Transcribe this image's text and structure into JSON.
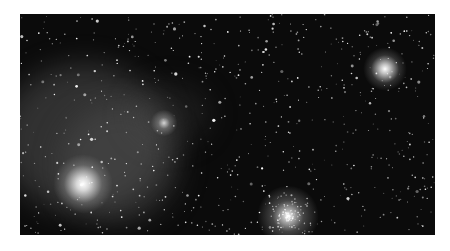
{
  "image": {
    "subject": "star field with nebulosity and star clusters",
    "background_color": "#ffffff",
    "sky_color": "#0b0b0b",
    "bright_stars": [
      {
        "x": 63,
        "y": 170,
        "r": 9
      },
      {
        "x": 365,
        "y": 55,
        "r": 6
      },
      {
        "x": 268,
        "y": 202,
        "r": 6
      },
      {
        "x": 144,
        "y": 109,
        "r": 4
      }
    ]
  }
}
